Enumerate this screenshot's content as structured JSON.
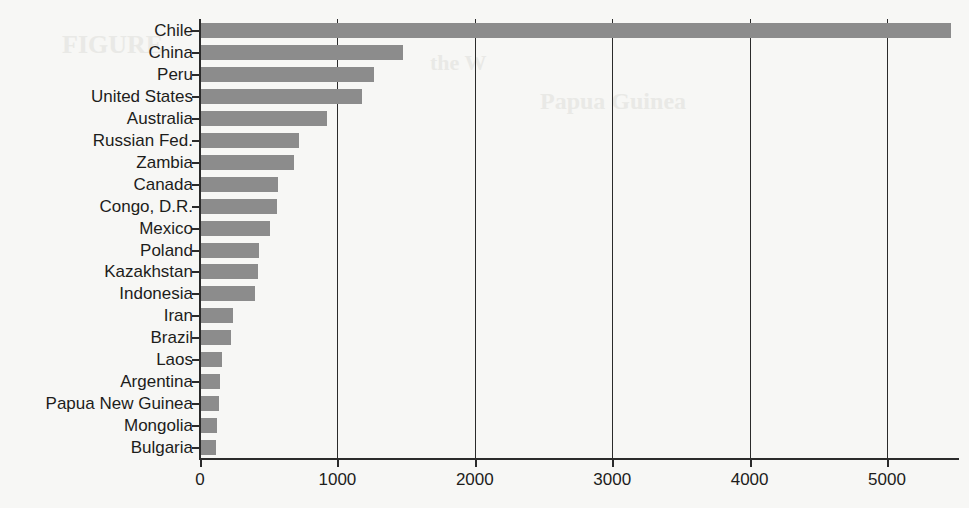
{
  "page": {
    "background_color": "#f7f7f5",
    "bleed_through_texts": [
      {
        "text": "FIGURE",
        "x": 62,
        "y": 30,
        "size": 26
      },
      {
        "text": "the W",
        "x": 430,
        "y": 50,
        "size": 22
      },
      {
        "text": "Papua Guinea",
        "x": 540,
        "y": 88,
        "size": 24
      }
    ]
  },
  "chart_data": {
    "type": "bar",
    "orientation": "horizontal",
    "title": "",
    "subtitle": "",
    "xlabel": "",
    "ylabel": "",
    "xlim": [
      0,
      5500
    ],
    "ylim": null,
    "grid": "vertical-only",
    "legend": "none",
    "bar_color": "#8c8c8c",
    "axis_color": "#2b2b2b",
    "x_ticks": [
      0,
      1000,
      2000,
      3000,
      4000,
      5000
    ],
    "x_tick_labels": [
      "0",
      "1000",
      "2000",
      "3000",
      "4000",
      "5000"
    ],
    "categories": [
      "Chile",
      "China",
      "Peru",
      "United States",
      "Australia",
      "Russian Fed.",
      "Zambia",
      "Canada",
      "Congo, D.R.",
      "Mexico",
      "Poland",
      "Kazakhstan",
      "Indonesia",
      "Iran",
      "Brazil",
      "Laos",
      "Argentina",
      "Papua New Guinea",
      "Mongolia",
      "Bulgaria"
    ],
    "values": [
      5460,
      1470,
      1260,
      1170,
      920,
      710,
      675,
      560,
      550,
      500,
      420,
      415,
      390,
      235,
      215,
      150,
      135,
      130,
      118,
      112
    ]
  }
}
